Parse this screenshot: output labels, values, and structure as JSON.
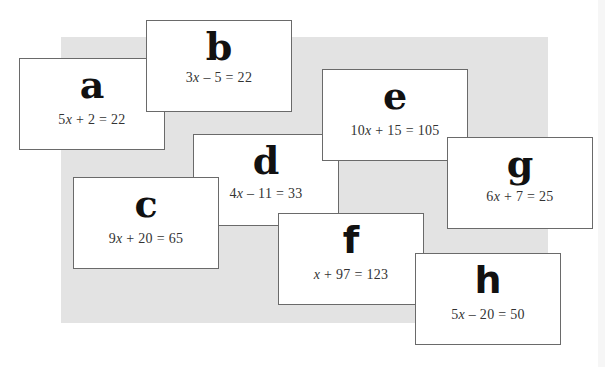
{
  "page": {
    "background_color": "#ffffff",
    "backdrop_color": "#e3e3e3"
  },
  "cards": [
    {
      "id": "a",
      "letter": "a",
      "coef": "5",
      "var": "x",
      "rest": " + 2 = 22",
      "equation": "5x + 2 = 22"
    },
    {
      "id": "b",
      "letter": "b",
      "coef": "3",
      "var": "x",
      "rest": " – 5 = 22",
      "equation": "3x – 5 = 22"
    },
    {
      "id": "c",
      "letter": "c",
      "coef": "9",
      "var": "x",
      "rest": " + 20 = 65",
      "equation": "9x + 20 = 65"
    },
    {
      "id": "d",
      "letter": "d",
      "coef": "4",
      "var": "x",
      "rest": " – 11 = 33",
      "equation": "4x – 11 = 33"
    },
    {
      "id": "e",
      "letter": "e",
      "coef": "10",
      "var": "x",
      "rest": " + 15 = 105",
      "equation": "10x + 15 = 105"
    },
    {
      "id": "f",
      "letter": "f",
      "coef": "",
      "var": "x",
      "rest": " + 97 = 123",
      "equation": "x + 97 = 123"
    },
    {
      "id": "g",
      "letter": "g",
      "coef": "6",
      "var": "x",
      "rest": " + 7 = 25",
      "equation": "6x + 7 = 25"
    },
    {
      "id": "h",
      "letter": "h",
      "coef": "5",
      "var": "x",
      "rest": " – 20 = 50",
      "equation": "5x – 20 = 50"
    }
  ]
}
